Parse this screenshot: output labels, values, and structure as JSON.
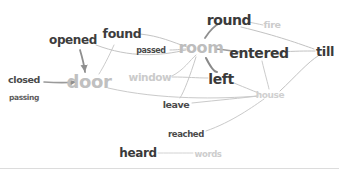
{
  "figure": {
    "width": 339,
    "height": 174,
    "background": "#ffffff",
    "divider_color": "#dcdcdc",
    "divider_y": 168,
    "edge_color": "#c9c9c9",
    "edge_color_dark": "#9a9a9a"
  },
  "chart_data": {
    "type": "graph",
    "title": "",
    "nodes": [
      {
        "id": "closed",
        "label": "closed",
        "x": 24,
        "y": 80,
        "size": 9.5,
        "color": "#4a4a4a"
      },
      {
        "id": "passing",
        "label": "passing",
        "x": 24,
        "y": 98,
        "size": 7.5,
        "color": "#5c5c5c"
      },
      {
        "id": "opened",
        "label": "opened",
        "x": 73,
        "y": 40,
        "size": 12,
        "color": "#3d3d3d"
      },
      {
        "id": "found",
        "label": "found",
        "x": 122,
        "y": 34,
        "size": 12.5,
        "color": "#3d3d3d"
      },
      {
        "id": "door",
        "label": "door",
        "x": 89,
        "y": 82,
        "size": 18,
        "color": "#c0c0c0"
      },
      {
        "id": "passed",
        "label": "passed",
        "x": 151,
        "y": 51,
        "size": 8,
        "color": "#4a4a4a"
      },
      {
        "id": "window",
        "label": "window",
        "x": 150,
        "y": 77,
        "size": 10.5,
        "color": "#cbcbcb"
      },
      {
        "id": "room",
        "label": "room",
        "x": 201,
        "y": 48,
        "size": 16,
        "color": "#bdbdbd"
      },
      {
        "id": "round",
        "label": "round",
        "x": 229,
        "y": 20,
        "size": 14,
        "color": "#3a3a3a"
      },
      {
        "id": "fire",
        "label": "fire",
        "x": 272,
        "y": 25,
        "size": 9.5,
        "color": "#cccccc"
      },
      {
        "id": "entered",
        "label": "entered",
        "x": 259,
        "y": 53,
        "size": 14,
        "color": "#3a3a3a"
      },
      {
        "id": "till",
        "label": "till",
        "x": 325,
        "y": 51,
        "size": 13,
        "color": "#3a3a3a"
      },
      {
        "id": "left",
        "label": "left",
        "x": 221,
        "y": 79,
        "size": 14,
        "color": "#3a3a3a"
      },
      {
        "id": "house",
        "label": "house",
        "x": 270,
        "y": 95,
        "size": 9,
        "color": "#d0d0d0"
      },
      {
        "id": "leave",
        "label": "leave",
        "x": 176,
        "y": 105,
        "size": 9.5,
        "color": "#4a4a4a"
      },
      {
        "id": "reached",
        "label": "reached",
        "x": 186,
        "y": 134,
        "size": 8.5,
        "color": "#4a4a4a"
      },
      {
        "id": "heard",
        "label": "heard",
        "x": 138,
        "y": 153,
        "size": 12,
        "color": "#3a3a3a"
      },
      {
        "id": "words",
        "label": "words",
        "x": 208,
        "y": 154,
        "size": 8.5,
        "color": "#cdcdcd"
      }
    ],
    "edges": [
      {
        "from": "closed",
        "to": "door",
        "d": "M 44,82 C 60,83 66,83 76,82",
        "width": 1.6,
        "color": "#9a9a9a",
        "arrow": true
      },
      {
        "from": "opened",
        "to": "door",
        "d": "M 80,50 C 83,60 84,64 85,72",
        "width": 1.8,
        "color": "#8f8f8f",
        "arrow": true
      },
      {
        "from": "found",
        "to": "door",
        "d": "M 114,45 C 108,58 104,66 99,74",
        "width": 1.0,
        "color": "#cccccc",
        "arrow": false
      },
      {
        "from": "opened",
        "to": "room",
        "d": "M 96,45 C 130,58 160,56 186,50",
        "width": 1.0,
        "color": "#c4c4c4",
        "arrow": false
      },
      {
        "from": "found",
        "to": "room",
        "d": "M 140,34 C 160,36 172,42 187,47",
        "width": 1.0,
        "color": "#c4c4c4",
        "arrow": false
      },
      {
        "from": "passed",
        "to": "room",
        "d": "M 170,50 C 178,50 182,49 186,49",
        "width": 1.0,
        "color": "#c4c4c4",
        "arrow": false
      },
      {
        "from": "window",
        "to": "room",
        "d": "M 172,76 C 184,70 190,60 196,55",
        "width": 1.0,
        "color": "#cccccc",
        "arrow": false
      },
      {
        "from": "window",
        "to": "left",
        "d": "M 172,77 C 188,77 196,78 208,78",
        "width": 1.0,
        "color": "#c8c8c8",
        "arrow": false
      },
      {
        "from": "room",
        "to": "round",
        "d": "M 205,38 C 210,30 216,25 220,23",
        "width": 1.8,
        "color": "#8f8f8f",
        "arrow": false
      },
      {
        "from": "round",
        "to": "fire",
        "d": "M 248,22 C 254,23 258,24 263,25",
        "width": 1.0,
        "color": "#cccccc",
        "arrow": false
      },
      {
        "from": "room",
        "to": "entered",
        "d": "M 216,49 C 226,50 232,51 240,52",
        "width": 1.6,
        "color": "#9a9a9a",
        "arrow": false
      },
      {
        "from": "room",
        "to": "left",
        "d": "M 206,58 C 210,66 214,72 217,72",
        "width": 2.0,
        "color": "#8a8a8a",
        "arrow": false
      },
      {
        "from": "room",
        "to": "leave",
        "d": "M 196,57 C 190,76 184,92 180,98",
        "width": 1.0,
        "color": "#c8c8c8",
        "arrow": false
      },
      {
        "from": "round",
        "to": "till",
        "d": "M 241,27 C 278,36 300,44 314,49",
        "width": 1.0,
        "color": "#c2c2c2",
        "arrow": false
      },
      {
        "from": "entered",
        "to": "till",
        "d": "M 280,52 C 296,51 304,51 315,51",
        "width": 1.0,
        "color": "#c2c2c2",
        "arrow": false
      },
      {
        "from": "entered",
        "to": "house",
        "d": "M 262,61 C 265,74 268,84 269,89",
        "width": 1.0,
        "color": "#cccccc",
        "arrow": false
      },
      {
        "from": "left",
        "to": "house",
        "d": "M 234,83 C 246,88 256,92 261,94",
        "width": 1.0,
        "color": "#c8c8c8",
        "arrow": false
      },
      {
        "from": "house",
        "to": "till",
        "d": "M 280,91 C 296,76 308,62 318,56",
        "width": 1.0,
        "color": "#c2c2c2",
        "arrow": false
      },
      {
        "from": "door",
        "to": "house",
        "d": "M 108,88 C 160,100 220,99 258,96",
        "width": 1.0,
        "color": "#cacaca",
        "arrow": false
      },
      {
        "from": "leave",
        "to": "house",
        "d": "M 192,103 C 220,100 242,98 258,96",
        "width": 1.0,
        "color": "#cacaca",
        "arrow": false
      },
      {
        "from": "reached",
        "to": "house",
        "d": "M 206,131 C 232,122 254,106 264,99",
        "width": 1.0,
        "color": "#cacaca",
        "arrow": false
      },
      {
        "from": "heard",
        "to": "words",
        "d": "M 158,153 C 174,153 184,153 193,153",
        "width": 1.0,
        "color": "#d2d2d2",
        "arrow": false
      }
    ],
    "xlabel": "",
    "ylabel": "",
    "legend": [],
    "grid": false
  }
}
